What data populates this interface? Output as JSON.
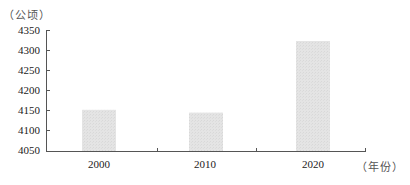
{
  "chart_data": {
    "type": "bar",
    "title": "",
    "xlabel": "（年份）",
    "ylabel": "（公顷）",
    "categories": [
      "2000",
      "2010",
      "2020"
    ],
    "values": [
      4153,
      4146,
      4325
    ],
    "ylim": [
      4050,
      4350
    ],
    "yticks": [
      "4350",
      "4300",
      "4250",
      "4200",
      "4150",
      "4100",
      "4050"
    ],
    "grid": false,
    "legend": null,
    "bar_color": "#e3e3e3"
  },
  "labels": {
    "y_unit": "（公顷）",
    "x_unit": "（年份）",
    "yticks": [
      "4350",
      "4300",
      "4250",
      "4200",
      "4150",
      "4100",
      "4050"
    ],
    "xticks": [
      "2000",
      "2010",
      "2020"
    ]
  }
}
